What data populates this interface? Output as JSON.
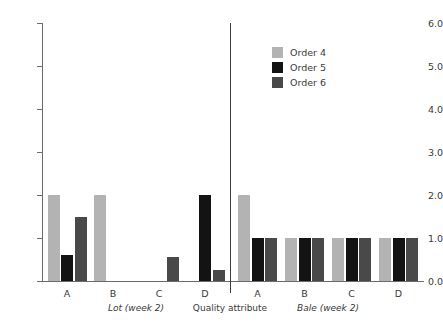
{
  "chart_data": {
    "type": "bar",
    "title": "",
    "xlabel": "Quality attribute",
    "ylabel": "",
    "ylim": [
      0,
      6
    ],
    "ytick_labels": [
      "0.0",
      "1.0",
      "2.0",
      "3.0",
      "4.0",
      "5.0",
      "6.0"
    ],
    "ytick_values": [
      0,
      1,
      2,
      3,
      4,
      5,
      6
    ],
    "grid": false,
    "legend_position": "top-right",
    "legend": [
      "Order 4",
      "Order 5",
      "Order 6"
    ],
    "series": [
      {
        "name": "Order 4",
        "color": "#b3b3b3"
      },
      {
        "name": "Order 5",
        "color": "#131313"
      },
      {
        "name": "Order 6",
        "color": "#494949"
      }
    ],
    "panels": [
      {
        "name": "Lot (week 2)",
        "label_italic": true,
        "categories": [
          "A",
          "B",
          "C",
          "D"
        ],
        "series": [
          {
            "name": "Order 4",
            "values": [
              2.0,
              2.0,
              0.0,
              0.0
            ]
          },
          {
            "name": "Order 5",
            "values": [
              0.6,
              0.0,
              0.0,
              2.0
            ]
          },
          {
            "name": "Order 6",
            "values": [
              1.5,
              0.0,
              0.55,
              0.25
            ]
          }
        ]
      },
      {
        "name": "Bale (week 2)",
        "label_italic": true,
        "categories": [
          "A",
          "B",
          "C",
          "D"
        ],
        "series": [
          {
            "name": "Order 4",
            "values": [
              2.0,
              1.0,
              1.0,
              1.0
            ]
          },
          {
            "name": "Order 5",
            "values": [
              1.0,
              1.0,
              1.0,
              1.0
            ]
          },
          {
            "name": "Order 6",
            "values": [
              1.0,
              1.0,
              1.0,
              1.0
            ]
          }
        ]
      }
    ]
  },
  "axis": {
    "x_center_label": "Quality attribute",
    "x_center_italic": false
  },
  "colors": {
    "order4": "#b3b3b3",
    "order5": "#131313",
    "order6": "#494949",
    "axis": "#6b6b6b",
    "divider": "#3d3d3d",
    "text": "#3a3a3a"
  }
}
